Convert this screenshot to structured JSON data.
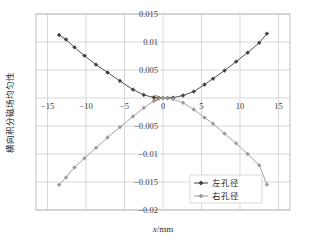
{
  "chart_data": {
    "type": "line",
    "title": "",
    "xlabel": "x/mm",
    "xlabel_italic_part": "x",
    "xlabel_rest": "/mm",
    "ylabel": "横向积分磁场均匀性",
    "xlim": [
      -16.5,
      16.5
    ],
    "ylim": [
      -0.02,
      0.015
    ],
    "xticks": [
      -15,
      -10,
      -5,
      0,
      5,
      10,
      15
    ],
    "xtick_labels": [
      "-15",
      "-10",
      "-5",
      "0",
      "5",
      "10",
      "15"
    ],
    "yticks": [
      0.015,
      0.01,
      0.005,
      0,
      -0.005,
      -0.01,
      -0.015,
      -0.02
    ],
    "ytick_labels": [
      "0.015",
      "0.01",
      "0.005",
      "0",
      "-0.005",
      "-0.01",
      "-0.015",
      "-0.02"
    ],
    "grid": true,
    "grid_color": "#c9c9c9",
    "legend_position": "bottom-right",
    "series": [
      {
        "name": "左孔径",
        "color": "#3f3f3f",
        "marker": "diamond",
        "x": [
          -13.5,
          -12.6,
          -11.5,
          -10.2,
          -8.7,
          -7.2,
          -5.6,
          -3.9,
          -2.5,
          -1.2,
          -0.5,
          0.0,
          0.6,
          1.3,
          2.6,
          4.0,
          5.4,
          6.5,
          8.0,
          9.5,
          11.0,
          12.5,
          13.5
        ],
        "values": [
          0.01125,
          0.01045,
          0.00905,
          0.00755,
          0.00595,
          0.00455,
          0.00305,
          0.0015,
          0.00055,
          0.0001,
          0.0,
          0.0,
          0.0,
          5e-05,
          0.00045,
          0.00115,
          0.0024,
          0.00345,
          0.0049,
          0.0065,
          0.0081,
          0.00985,
          0.0115
        ]
      },
      {
        "name": "右孔径",
        "color": "#9a9a9a",
        "marker": "diamond",
        "x": [
          -13.5,
          -12.6,
          -11.5,
          -10.2,
          -8.7,
          -7.2,
          -5.6,
          -3.9,
          -2.5,
          -1.2,
          -0.5,
          0.0,
          0.6,
          1.3,
          2.6,
          4.0,
          5.4,
          6.5,
          8.0,
          9.5,
          11.0,
          12.5,
          13.5
        ],
        "values": [
          -0.0155,
          -0.0142,
          -0.0124,
          -0.01075,
          -0.0089,
          -0.00705,
          -0.0052,
          -0.0033,
          -0.00175,
          -0.00055,
          -0.0001,
          0.0,
          -5e-05,
          -0.0002,
          -0.00085,
          -0.00205,
          -0.0035,
          -0.0046,
          -0.00635,
          -0.0081,
          -0.01,
          -0.012,
          -0.01545
        ]
      }
    ]
  },
  "legend": {
    "items": [
      {
        "label": "左孔径",
        "color": "#3f3f3f"
      },
      {
        "label": "右孔径",
        "color": "#9a9a9a"
      }
    ]
  },
  "axes": {
    "x_title_italic": "x",
    "x_title_rest": "/mm",
    "y_title": "横向积分磁场均匀性"
  }
}
